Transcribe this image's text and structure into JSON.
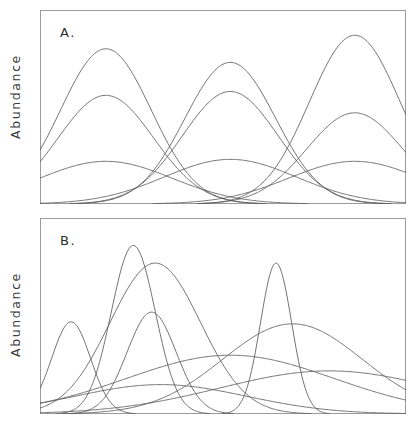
{
  "figure": {
    "background_color": "#ffffff",
    "line_color": "#5a5a5a",
    "frame_color": "#9a9a9a",
    "width": 418,
    "height": 426
  },
  "panels": [
    {
      "id": "A",
      "letter": "A.",
      "ylabel": "Abundance"
    },
    {
      "id": "B",
      "letter": "B.",
      "ylabel": "Abundance"
    }
  ],
  "chart_data": [
    {
      "type": "line",
      "title": "A.",
      "subtitle": "",
      "xlabel": "",
      "ylabel": "Abundance",
      "xlim": [
        0,
        1
      ],
      "ylim": [
        0,
        1
      ],
      "grid": false,
      "legend": null,
      "annotations": [
        "A."
      ],
      "tick_labels": {
        "x": [],
        "y": []
      },
      "description": "Regularly spaced unimodal species response curves; identical bell shapes repeating at even intervals along the gradient, three amplitude classes (tall, medium, low-broad) repeating three times.",
      "curve_model": "gaussian",
      "series": [
        {
          "name": "tall-1",
          "center": 0.18,
          "width": 0.175,
          "amplitude": 0.8
        },
        {
          "name": "medium-1",
          "center": 0.18,
          "width": 0.185,
          "amplitude": 0.56
        },
        {
          "name": "broad-1",
          "center": 0.18,
          "width": 0.255,
          "amplitude": 0.22
        },
        {
          "name": "tall-2",
          "center": 0.52,
          "width": 0.175,
          "amplitude": 0.73
        },
        {
          "name": "medium-2",
          "center": 0.52,
          "width": 0.185,
          "amplitude": 0.58
        },
        {
          "name": "broad-2",
          "center": 0.52,
          "width": 0.255,
          "amplitude": 0.23
        },
        {
          "name": "tall-3",
          "center": 0.86,
          "width": 0.175,
          "amplitude": 0.87
        },
        {
          "name": "medium-3",
          "center": 0.86,
          "width": 0.185,
          "amplitude": 0.47
        },
        {
          "name": "broad-3",
          "center": 0.86,
          "width": 0.255,
          "amplitude": 0.22
        }
      ]
    },
    {
      "type": "line",
      "title": "B.",
      "subtitle": "",
      "xlabel": "",
      "ylabel": "Abundance",
      "xlim": [
        0,
        1
      ],
      "ylim": [
        0,
        1
      ],
      "grid": false,
      "legend": null,
      "annotations": [
        "B."
      ],
      "tick_labels": {
        "x": [],
        "y": []
      },
      "description": "Irregularly spaced unimodal species response curves of differing widths, heights and optima, overlapping individualistically along the gradient.",
      "curve_model": "gaussian",
      "series": [
        {
          "name": "small-narrow-left",
          "center": 0.085,
          "width": 0.075,
          "amplitude": 0.47
        },
        {
          "name": "tall-narrow-a",
          "center": 0.255,
          "width": 0.085,
          "amplitude": 0.86
        },
        {
          "name": "broad-mid-high",
          "center": 0.315,
          "width": 0.175,
          "amplitude": 0.77
        },
        {
          "name": "medium-mid",
          "center": 0.305,
          "width": 0.095,
          "amplitude": 0.52
        },
        {
          "name": "tall-narrow-b",
          "center": 0.645,
          "width": 0.06,
          "amplitude": 0.77
        },
        {
          "name": "broad-right",
          "center": 0.69,
          "width": 0.27,
          "amplitude": 0.46
        },
        {
          "name": "very-broad-low",
          "center": 0.79,
          "width": 0.42,
          "amplitude": 0.22
        },
        {
          "name": "broad-low-left",
          "center": 0.33,
          "width": 0.33,
          "amplitude": 0.15
        },
        {
          "name": "rising-left-edge",
          "center": 0.52,
          "width": 0.4,
          "amplitude": 0.3
        }
      ]
    }
  ]
}
